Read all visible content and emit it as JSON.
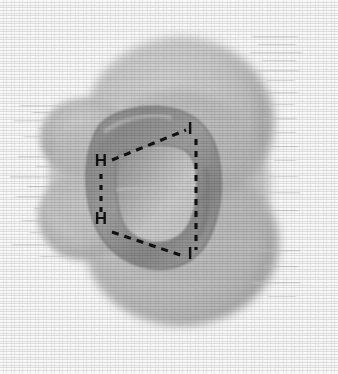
{
  "figure": {
    "type": "scientific-illustration",
    "render_style": "grayscale halftone scan",
    "background_color": "#fdfdfd",
    "ink_color": "#111111"
  },
  "atom_labels": [
    {
      "id": "h-top",
      "text": "H",
      "x": 101,
      "y": 166,
      "anchor": "middle"
    },
    {
      "id": "h-bottom",
      "text": "H",
      "x": 101,
      "y": 223,
      "anchor": "middle"
    },
    {
      "id": "i-top",
      "text": "I",
      "x": 190,
      "y": 134,
      "anchor": "middle"
    },
    {
      "id": "i-bottom",
      "text": "I",
      "x": 190,
      "y": 259,
      "anchor": "middle"
    }
  ],
  "bonds": [
    {
      "id": "bond-h-top-i-top",
      "from": "H",
      "to": "I",
      "style": "dashed",
      "x1": 110,
      "y1": 161,
      "x2": 186,
      "y2": 130
    },
    {
      "id": "bond-h-bottom-i-bottom",
      "from": "H",
      "to": "I",
      "style": "dashed",
      "x1": 110,
      "y1": 231,
      "x2": 186,
      "y2": 256
    },
    {
      "id": "bond-h-top-h-bottom",
      "from": "H",
      "to": "H",
      "style": "dashed",
      "x1": 101,
      "y1": 174,
      "x2": 101,
      "y2": 214
    },
    {
      "id": "bond-i-top-i-bottom",
      "from": "I",
      "to": "I",
      "style": "dashed",
      "x1": 196,
      "y1": 138,
      "x2": 196,
      "y2": 251
    }
  ],
  "lobes": [
    {
      "id": "back-lobe-upper-right",
      "shade": "#b9b9b9",
      "role": "rear isosurface lobe"
    },
    {
      "id": "back-lobe-lower-right",
      "shade": "#bdbdbd",
      "role": "rear isosurface lobe"
    },
    {
      "id": "side-lobe-left-upper",
      "shade": "#b4b4b4",
      "role": "left isosurface lobe"
    },
    {
      "id": "side-lobe-left-lower",
      "shade": "#c2c2c2",
      "role": "left isosurface lobe"
    },
    {
      "id": "torus-front",
      "shade": "#9a9a9a",
      "role": "front ring-shaped isosurface"
    },
    {
      "id": "torus-hole",
      "shade": "#cfcfcf",
      "role": "ring aperture"
    }
  ],
  "colors": {
    "background": "#fdfdfd",
    "lobe_light": "#d4d4d4",
    "lobe_mid": "#b5b5b5",
    "lobe_dark": "#8e8e8e",
    "torus_edge": "#787878",
    "ink": "#111111"
  },
  "artifacts": {
    "description": "horizontal scan streaks along left and right lobe margins",
    "left_streak_count": 16,
    "right_streak_count": 18
  }
}
